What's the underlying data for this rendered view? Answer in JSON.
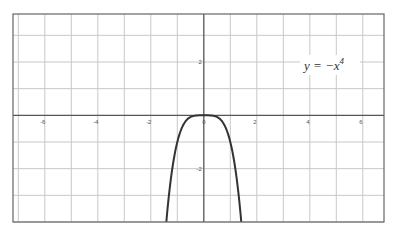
{
  "chart_data": {
    "type": "line",
    "title": "",
    "function": "y = -x^4",
    "annotation": {
      "text": "y = −x",
      "superscript": "4"
    },
    "xlabel": "",
    "ylabel": "",
    "xlim": [
      -7.2,
      6.8
    ],
    "ylim": [
      -4,
      3.8
    ],
    "x_ticks": [
      -6,
      -4,
      -2,
      0,
      2,
      4,
      6
    ],
    "x_tick_labels": [
      "-6",
      "-4",
      "-2",
      "0",
      "2",
      "4",
      "6"
    ],
    "y_ticks": [
      2,
      0,
      -2
    ],
    "y_tick_labels": [
      "2",
      "0",
      "-2"
    ],
    "grid": true,
    "grid_step": 1,
    "legend": null,
    "series": [
      {
        "name": "y = -x^4",
        "color": "#333333",
        "x": [
          -1.414,
          -1.3,
          -1.2,
          -1.1,
          -1.0,
          -0.9,
          -0.8,
          -0.6,
          -0.4,
          -0.2,
          0,
          0.2,
          0.4,
          0.6,
          0.8,
          0.9,
          1.0,
          1.1,
          1.2,
          1.3,
          1.414
        ],
        "y": [
          -4.0,
          -2.856,
          -2.074,
          -1.464,
          -1.0,
          -0.656,
          -0.41,
          -0.13,
          -0.026,
          -0.002,
          0,
          -0.002,
          -0.026,
          -0.13,
          -0.41,
          -0.656,
          -1.0,
          -1.464,
          -2.074,
          -2.856,
          -4.0
        ]
      }
    ]
  },
  "colors": {
    "grid": "#c8c8c8",
    "axis": "#555555",
    "frame": "#666666",
    "curve": "#333333"
  }
}
